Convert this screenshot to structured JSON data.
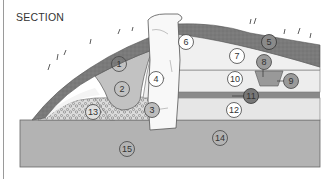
{
  "title": "SECTION",
  "colors": {
    "turf": "#7d7d7d",
    "light_fill": "#ececec",
    "mid_fill": "#c4c4c4",
    "base": "#b3b3b3",
    "rubble": "#d8d8d8",
    "stone": "#f7f7f7",
    "dark_band": "#8a8a8a",
    "outline": "#555555"
  },
  "labels": [
    {
      "id": "1",
      "text": "1"
    },
    {
      "id": "2",
      "text": "2"
    },
    {
      "id": "3",
      "text": "3"
    },
    {
      "id": "4",
      "text": "4"
    },
    {
      "id": "5",
      "text": "5"
    },
    {
      "id": "6",
      "text": "6"
    },
    {
      "id": "7",
      "text": "7"
    },
    {
      "id": "8",
      "text": "8"
    },
    {
      "id": "9",
      "text": "9"
    },
    {
      "id": "10",
      "text": "10"
    },
    {
      "id": "11",
      "text": "11"
    },
    {
      "id": "12",
      "text": "12"
    },
    {
      "id": "13",
      "text": "13"
    },
    {
      "id": "14",
      "text": "14"
    },
    {
      "id": "15",
      "text": "15"
    }
  ]
}
